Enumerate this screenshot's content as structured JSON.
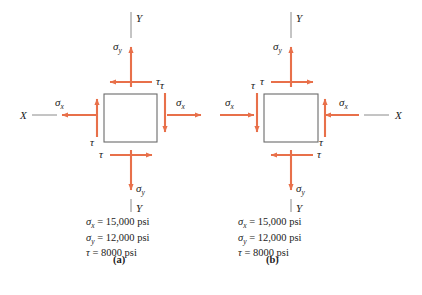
{
  "figure": {
    "colors": {
      "arrow": "#E8704A",
      "box_stroke": "#6b6b6b",
      "axis_line": "#8a8a8a",
      "text": "#1a1a1a",
      "background": "#ffffff"
    },
    "symbols": {
      "sigma": "σ",
      "tau": "τ",
      "sub_x": "x",
      "sub_y": "y",
      "axis_x": "X",
      "axis_y": "Y"
    },
    "panels": [
      {
        "tag": "(a)",
        "description": "Stress element with tensile normal stresses directed outward",
        "sigma_x_direction": "outward",
        "sigma_y_direction": "outward",
        "shear_sense": "counterclockwise",
        "arrows": [
          {
            "name": "sigma-y-top",
            "label": "σ",
            "subscript": "y",
            "points": "up"
          },
          {
            "name": "tau-top",
            "label": "τ",
            "subscript": "",
            "points": "left"
          },
          {
            "name": "sigma-x-left",
            "label": "σ",
            "subscript": "x",
            "points": "left"
          },
          {
            "name": "tau-left",
            "label": "τ",
            "subscript": "",
            "points": "up"
          },
          {
            "name": "sigma-x-right",
            "label": "σ",
            "subscript": "x",
            "points": "right"
          },
          {
            "name": "tau-right",
            "label": "τ",
            "subscript": "",
            "points": "down"
          },
          {
            "name": "tau-bottom",
            "label": "τ",
            "subscript": "",
            "points": "right"
          },
          {
            "name": "sigma-y-bottom",
            "label": "σ",
            "subscript": "y",
            "points": "down"
          }
        ],
        "axes": [
          {
            "name": "y-axis-top",
            "label": "Y"
          },
          {
            "name": "y-axis-bottom",
            "label": "Y"
          },
          {
            "name": "x-axis-left",
            "label": "X"
          }
        ],
        "caption": [
          {
            "symbol": "σ",
            "subscript": "x",
            "value": "15,000 psi"
          },
          {
            "symbol": "σ",
            "subscript": "y",
            "value": "12,000 psi"
          },
          {
            "symbol": "τ",
            "subscript": "",
            "value": "8000 psi"
          }
        ]
      },
      {
        "tag": "(b)",
        "description": "Stress element with compressive normal stresses directed inward",
        "sigma_x_direction": "inward",
        "sigma_y_direction": "outward",
        "shear_sense": "clockwise",
        "arrows": [
          {
            "name": "sigma-y-top",
            "label": "σ",
            "subscript": "y",
            "points": "up"
          },
          {
            "name": "tau-top",
            "label": "τ",
            "subscript": "",
            "points": "right"
          },
          {
            "name": "sigma-x-left",
            "label": "σ",
            "subscript": "x",
            "points": "right"
          },
          {
            "name": "tau-left",
            "label": "τ",
            "subscript": "",
            "points": "down"
          },
          {
            "name": "sigma-x-right",
            "label": "σ",
            "subscript": "x",
            "points": "left"
          },
          {
            "name": "tau-right",
            "label": "τ",
            "subscript": "",
            "points": "up"
          },
          {
            "name": "tau-bottom",
            "label": "τ",
            "subscript": "",
            "points": "left"
          },
          {
            "name": "sigma-y-bottom",
            "label": "σ",
            "subscript": "y",
            "points": "down"
          }
        ],
        "axes": [
          {
            "name": "y-axis-top",
            "label": "Y"
          },
          {
            "name": "y-axis-bottom",
            "label": "Y"
          },
          {
            "name": "x-axis-right",
            "label": "X"
          }
        ],
        "caption": [
          {
            "symbol": "σ",
            "subscript": "x",
            "value": "15,000 psi"
          },
          {
            "symbol": "σ",
            "subscript": "y",
            "value": "12,000 psi"
          },
          {
            "symbol": "τ",
            "subscript": "",
            "value": "8000 psi"
          }
        ]
      }
    ]
  }
}
